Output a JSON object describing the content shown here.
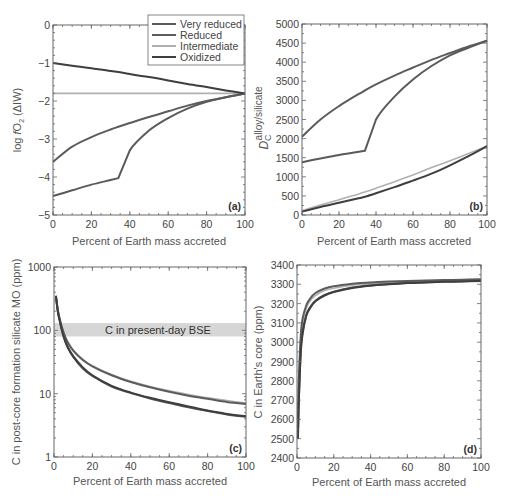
{
  "colors": {
    "very_reduced": "#5a5a5a",
    "reduced": "#5c5c5c",
    "intermediate": "#b0b0b0",
    "oxidized": "#3e3e3e",
    "band": "#d6d6d6",
    "frame": "#666666"
  },
  "legend": {
    "items": [
      {
        "key": "very_reduced",
        "label": "Very reduced"
      },
      {
        "key": "reduced",
        "label": "Reduced"
      },
      {
        "key": "intermediate",
        "label": "Intermediate"
      },
      {
        "key": "oxidized",
        "label": "Oxidized"
      }
    ]
  },
  "chart_data": [
    {
      "panel": "a",
      "tag": "(a)",
      "type": "line",
      "xlabel": "Percent of Earth mass accreted",
      "ylabel": "log fO2 (ΔIW)",
      "xlim": [
        0,
        100
      ],
      "ylim": [
        -5,
        0
      ],
      "xticks": [
        "0",
        "20",
        "40",
        "60",
        "80",
        "100"
      ],
      "yticks": [
        "0",
        "−1",
        "−2",
        "−3",
        "−4",
        "−5"
      ],
      "legend_position": "upper right",
      "grid": false,
      "x": [
        0,
        10,
        20,
        30,
        34,
        40,
        50,
        60,
        70,
        80,
        90,
        100
      ],
      "series": [
        {
          "name": "Very reduced",
          "key": "very_reduced",
          "values": [
            -4.5,
            -4.35,
            -4.2,
            -4.08,
            -4.03,
            -3.3,
            -2.78,
            -2.45,
            -2.2,
            -2.02,
            -1.9,
            -1.8
          ]
        },
        {
          "name": "Reduced",
          "key": "reduced",
          "values": [
            -3.6,
            -3.2,
            -2.95,
            -2.75,
            -2.68,
            -2.58,
            -2.42,
            -2.27,
            -2.12,
            -2.0,
            -1.9,
            -1.8
          ]
        },
        {
          "name": "Intermediate",
          "key": "intermediate",
          "values": [
            -1.8,
            -1.8,
            -1.8,
            -1.8,
            -1.8,
            -1.8,
            -1.8,
            -1.8,
            -1.8,
            -1.8,
            -1.8,
            -1.8
          ]
        },
        {
          "name": "Oxidized",
          "key": "oxidized",
          "values": [
            -1.0,
            -1.07,
            -1.14,
            -1.21,
            -1.24,
            -1.29,
            -1.37,
            -1.46,
            -1.55,
            -1.63,
            -1.72,
            -1.8
          ]
        }
      ]
    },
    {
      "panel": "b",
      "tag": "(b)",
      "type": "line",
      "xlabel": "Percent of Earth mass accreted",
      "ylabel": "D_C^alloy/silicate",
      "ylabel_main": "D",
      "ylabel_sub": "C",
      "ylabel_sup": "alloy/silicate",
      "xlim": [
        0,
        100
      ],
      "ylim": [
        0,
        5000
      ],
      "xticks": [
        "0",
        "20",
        "40",
        "60",
        "80",
        "100"
      ],
      "yticks": [
        "5000",
        "4500",
        "4000",
        "3500",
        "3000",
        "2500",
        "2000",
        "1500",
        "1000",
        "500",
        "0"
      ],
      "grid": false,
      "x": [
        0,
        10,
        20,
        30,
        34,
        40,
        50,
        60,
        70,
        80,
        90,
        100
      ],
      "series": [
        {
          "name": "Very reduced",
          "key": "very_reduced",
          "values": [
            1380,
            1480,
            1570,
            1650,
            1680,
            2500,
            3100,
            3550,
            3900,
            4180,
            4380,
            4560
          ]
        },
        {
          "name": "Reduced",
          "key": "reduced",
          "values": [
            2050,
            2500,
            2850,
            3150,
            3260,
            3420,
            3650,
            3860,
            4060,
            4240,
            4410,
            4560
          ]
        },
        {
          "name": "Intermediate",
          "key": "intermediate",
          "values": [
            110,
            260,
            400,
            540,
            600,
            700,
            870,
            1050,
            1240,
            1420,
            1610,
            1800
          ]
        },
        {
          "name": "Oxidized",
          "key": "oxidized",
          "values": [
            90,
            210,
            320,
            430,
            480,
            570,
            730,
            900,
            1080,
            1300,
            1540,
            1800
          ]
        }
      ]
    },
    {
      "panel": "c",
      "tag": "(c)",
      "type": "line",
      "xlabel": "Percent of Earth mass accreted",
      "ylabel": "C in post-core formation silicate MO (ppm)",
      "xlim": [
        0,
        100
      ],
      "ylim": [
        1,
        1000
      ],
      "yscale": "log",
      "xticks": [
        "0",
        "20",
        "40",
        "60",
        "80",
        "100"
      ],
      "yticks": [
        "1000",
        "100",
        "10",
        "1"
      ],
      "grid": false,
      "annotation": {
        "label": "C in present-day BSE",
        "range": [
          80,
          130
        ]
      },
      "x": [
        1,
        2,
        3,
        5,
        7,
        10,
        15,
        20,
        30,
        40,
        50,
        60,
        70,
        80,
        90,
        100
      ],
      "series": [
        {
          "name": "Very reduced",
          "key": "very_reduced",
          "values": [
            350,
            200,
            140,
            80,
            55,
            38,
            25,
            19,
            13,
            10.2,
            8.4,
            7.1,
            6.1,
            5.3,
            4.7,
            4.3
          ]
        },
        {
          "name": "Reduced",
          "key": "reduced",
          "values": [
            350,
            210,
            150,
            92,
            66,
            48,
            34,
            27,
            19.5,
            15.3,
            12.6,
            10.7,
            9.3,
            8.3,
            7.4,
            6.9
          ]
        },
        {
          "name": "Intermediate",
          "key": "intermediate",
          "values": [
            350,
            210,
            150,
            92,
            67,
            48,
            35,
            27.5,
            20,
            15.7,
            13,
            11.1,
            9.7,
            8.6,
            7.8,
            7.1
          ]
        },
        {
          "name": "Oxidized",
          "key": "oxidized",
          "values": [
            350,
            200,
            140,
            80,
            56,
            39,
            26,
            19.5,
            13.3,
            10.4,
            8.6,
            7.3,
            6.3,
            5.4,
            4.8,
            4.4
          ]
        }
      ]
    },
    {
      "panel": "d",
      "tag": "(d)",
      "type": "line",
      "xlabel": "Percent of Earth mass accreted",
      "ylabel": "C in Earth's core (ppm)",
      "xlim": [
        0,
        100
      ],
      "ylim": [
        2400,
        3400
      ],
      "xticks": [
        "0",
        "20",
        "40",
        "60",
        "80",
        "100"
      ],
      "yticks": [
        "3400",
        "3300",
        "3200",
        "3100",
        "3000",
        "2900",
        "2800",
        "2700",
        "2600",
        "2500",
        "2400"
      ],
      "grid": false,
      "x": [
        0.5,
        1,
        2,
        3,
        5,
        7,
        10,
        15,
        20,
        30,
        40,
        50,
        60,
        70,
        80,
        90,
        100
      ],
      "series": [
        {
          "name": "Very reduced",
          "key": "very_reduced",
          "values": [
            2500,
            2700,
            2950,
            3050,
            3140,
            3180,
            3215,
            3245,
            3262,
            3283,
            3295,
            3302,
            3307,
            3311,
            3314,
            3316,
            3318
          ]
        },
        {
          "name": "Reduced",
          "key": "reduced",
          "values": [
            2600,
            2800,
            3030,
            3120,
            3190,
            3225,
            3255,
            3278,
            3290,
            3303,
            3310,
            3314,
            3317,
            3320,
            3322,
            3324,
            3326
          ]
        },
        {
          "name": "Intermediate",
          "key": "intermediate",
          "values": [
            2580,
            2780,
            3010,
            3100,
            3175,
            3212,
            3242,
            3268,
            3280,
            3296,
            3304,
            3309,
            3313,
            3316,
            3318,
            3320,
            3322
          ]
        },
        {
          "name": "Oxidized",
          "key": "oxidized",
          "values": [
            2500,
            2690,
            2940,
            3040,
            3135,
            3175,
            3212,
            3242,
            3260,
            3281,
            3293,
            3300,
            3306,
            3310,
            3313,
            3315,
            3317
          ]
        }
      ]
    }
  ]
}
